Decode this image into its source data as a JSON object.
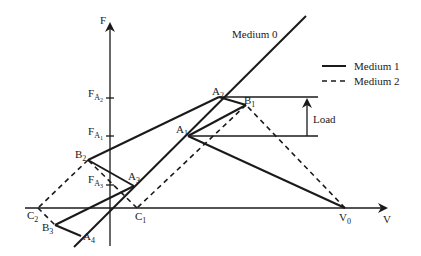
{
  "axes": {
    "y_label": "F",
    "x_label": "V",
    "y_ticks": [
      {
        "main": "F",
        "sub": "A",
        "subsub": "2"
      },
      {
        "main": "F",
        "sub": "A",
        "subsub": "1"
      },
      {
        "main": "F",
        "sub": "A",
        "subsub": "3"
      }
    ]
  },
  "lines": {
    "medium0_label": "Medium 0"
  },
  "points": {
    "A1": {
      "main": "A",
      "sub": "1"
    },
    "A2": {
      "main": "A",
      "sub": "2"
    },
    "A3": {
      "main": "A",
      "sub": "3"
    },
    "A4": {
      "main": "A",
      "sub": "4"
    },
    "B1": {
      "main": "B",
      "sub": "1"
    },
    "B2": {
      "main": "B",
      "sub": "2"
    },
    "B3": {
      "main": "B",
      "sub": "3"
    },
    "C1": {
      "main": "C",
      "sub": "1"
    },
    "C2": {
      "main": "C",
      "sub": "2"
    },
    "V0": {
      "main": "V",
      "sub": "0"
    }
  },
  "legend": {
    "items": [
      {
        "label": "Medium 1",
        "style": "solid"
      },
      {
        "label": "Medium 2",
        "style": "dashed"
      }
    ]
  },
  "annotation": {
    "load_label": "Load"
  },
  "colors": {
    "ink": "#1a1a1a",
    "background": "#ffffff"
  }
}
